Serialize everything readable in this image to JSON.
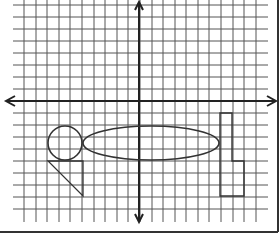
{
  "diagram": {
    "type": "coordinate-grid",
    "colors": {
      "grid": "#555555",
      "axis": "#222222",
      "shape": "#333333",
      "background": "#ffffff",
      "border": "#333333"
    },
    "grid": {
      "x_lines": [
        24,
        36,
        47,
        59,
        70,
        82,
        94,
        105,
        117,
        128,
        140,
        152,
        163,
        175,
        186,
        198,
        209,
        221,
        233,
        244,
        256
      ],
      "y_lines": [
        5,
        17,
        29,
        41,
        53,
        65,
        77,
        89,
        101,
        113,
        125,
        137,
        149,
        161,
        173,
        185,
        197,
        209
      ],
      "x_range": [
        13,
        268
      ],
      "y_range": [
        0,
        222
      ]
    },
    "axes": {
      "x_axis": {
        "y": 101,
        "x_start": 6,
        "x_end": 276
      },
      "y_axis": {
        "x": 139,
        "y_start": 2,
        "y_end": 222
      }
    },
    "shapes": {
      "circle": {
        "cx": 65,
        "cy": 143,
        "r": 17
      },
      "triangle": {
        "points": "48,161 83,161 83,196"
      },
      "ellipse": {
        "cx": 151,
        "cy": 143,
        "rx": 68,
        "ry": 17
      },
      "l_shape": {
        "points": "220,113 232,113 232,161 244,161 244,196 220,196"
      }
    },
    "frame": {
      "bottom_y": 232,
      "right_x": 278
    }
  }
}
